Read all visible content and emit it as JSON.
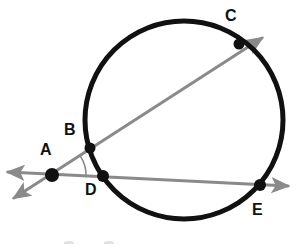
{
  "figure": {
    "canvas": {
      "width": 298,
      "height": 244,
      "background": "#ffffff"
    },
    "colors": {
      "circle_stroke": "#111111",
      "ray_stroke": "#8a8a8a",
      "point_fill": "#111111",
      "label_color": "#111111",
      "angle_arc": "#8a8a8a"
    }
  },
  "circle": {
    "name": "main-circle",
    "center_x": 184,
    "center_y": 120,
    "radius": 99,
    "stroke_width": 5
  },
  "points": [
    {
      "id": "A",
      "label": "A",
      "cx": 52,
      "cy": 175,
      "r": 7,
      "label_x": 40,
      "label_y": 142,
      "on_circle": false,
      "dot_visible": true
    },
    {
      "id": "B",
      "label": "B",
      "cx": 90,
      "cy": 148,
      "r": 5.5,
      "label_x": 64,
      "label_y": 122,
      "on_circle": true,
      "dot_visible": true
    },
    {
      "id": "C",
      "label": "C",
      "cx": 239,
      "cy": 44,
      "r": 5.5,
      "label_x": 225,
      "label_y": 8,
      "on_circle": true,
      "dot_visible": true
    },
    {
      "id": "D",
      "label": "D",
      "cx": 103,
      "cy": 176,
      "r": 6,
      "label_x": 85,
      "label_y": 182,
      "on_circle": true,
      "dot_visible": true
    },
    {
      "id": "E",
      "label": "E",
      "cx": 260,
      "cy": 185,
      "r": 6,
      "label_x": 252,
      "label_y": 202,
      "on_circle": true,
      "dot_visible": true
    }
  ],
  "rays": [
    {
      "id": "ray-ABC",
      "name": "secant-ray-A-B-C",
      "description": "Ray from A through B and C with arrowheads at both ends",
      "x1": 14,
      "y1": 198,
      "x2": 262,
      "y2": 38,
      "stroke_width": 3,
      "arrow_start": true,
      "arrow_end": true
    },
    {
      "id": "ray-ADE",
      "name": "secant-ray-A-D-E",
      "description": "Ray from A through D and E with arrowheads at both ends",
      "x1": 8,
      "y1": 172,
      "x2": 288,
      "y2": 186,
      "stroke_width": 3,
      "arrow_start": true,
      "arrow_end": true
    }
  ],
  "angle_marker": {
    "name": "angle-arc-at-A",
    "vertex": "A",
    "vertex_x": 52,
    "vertex_y": 175,
    "radius": 34,
    "stroke_width": 1.6,
    "label": ""
  },
  "bottom_fragment": {
    "name": "cropped-text-fragment",
    "description": "Faint cut-off tops of characters along the bottom edge",
    "marks": [
      {
        "x": 64,
        "y": 241,
        "w": 10,
        "h": 4
      },
      {
        "x": 104,
        "y": 241,
        "w": 10,
        "h": 4
      }
    ]
  }
}
